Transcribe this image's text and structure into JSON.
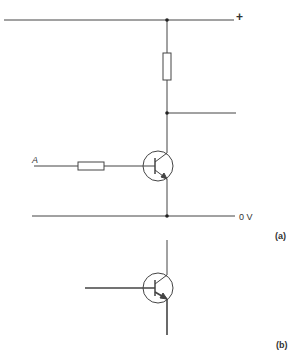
{
  "diagram": {
    "type": "transistor-switch-circuit",
    "stroke_color": "#444444",
    "labels": {
      "supply_positive": "+",
      "ground": "0 V",
      "input": "A",
      "figure_a": "(a)",
      "figure_b": "(b)"
    },
    "components": [
      {
        "id": "R1",
        "type": "resistor",
        "role": "collector-load"
      },
      {
        "id": "R2",
        "type": "resistor",
        "role": "base-input"
      },
      {
        "id": "Q1",
        "type": "npn-transistor"
      },
      {
        "id": "Q2",
        "type": "npn-transistor",
        "style": "bold-leads"
      }
    ]
  }
}
